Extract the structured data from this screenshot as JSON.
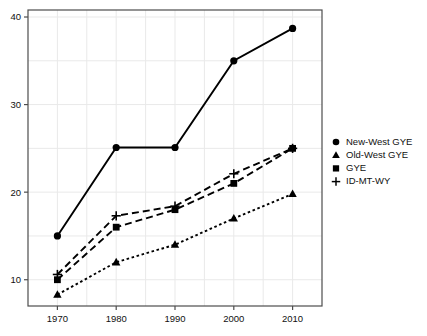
{
  "chart_data": {
    "type": "line",
    "title": "",
    "xlabel": "",
    "ylabel": "",
    "x": [
      1970,
      1980,
      1990,
      2000,
      2010
    ],
    "xtick_labels": [
      "1970",
      "1980",
      "1990",
      "2000",
      "2010"
    ],
    "ytick_labels": [
      "10",
      "20",
      "30",
      "40"
    ],
    "yticks": [
      10,
      20,
      30,
      40
    ],
    "xlim": [
      1965,
      2015
    ],
    "ylim": [
      7.0,
      40.8
    ],
    "grid": true,
    "legend_position": "right",
    "series": [
      {
        "name": "New-West GYE",
        "marker": "circle",
        "linestyle": "solid",
        "values": [
          15.0,
          25.1,
          25.1,
          35.0,
          38.7
        ]
      },
      {
        "name": "Old-West GYE",
        "marker": "triangle",
        "linestyle": "dotted",
        "values": [
          8.3,
          12.0,
          14.0,
          17.0,
          19.8
        ]
      },
      {
        "name": "GYE",
        "marker": "square",
        "linestyle": "dashed",
        "values": [
          10.0,
          16.0,
          18.0,
          21.0,
          25.0
        ]
      },
      {
        "name": "ID-MT-WY",
        "marker": "plus",
        "linestyle": "dashed",
        "values": [
          10.6,
          17.3,
          18.4,
          22.1,
          25.0
        ]
      }
    ]
  },
  "colors": {
    "line": "#000000",
    "grid": "#e9e9e9",
    "frame": "#4d4d4d",
    "text": "#111111",
    "background": "#ffffff"
  },
  "legend": {
    "entries": [
      {
        "label": "New-West GYE",
        "marker": "circle"
      },
      {
        "label": "Old-West GYE",
        "marker": "triangle"
      },
      {
        "label": "GYE",
        "marker": "square"
      },
      {
        "label": "ID-MT-WY",
        "marker": "plus"
      }
    ]
  }
}
